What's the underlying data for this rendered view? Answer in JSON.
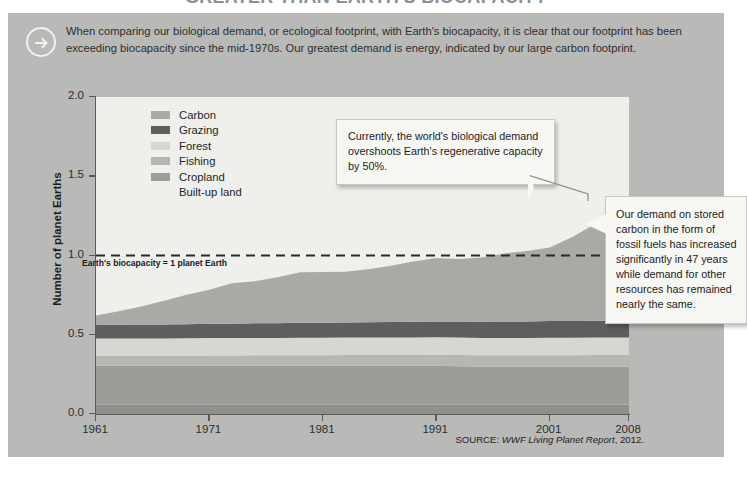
{
  "page": {
    "title_cut_off": "GREATER THAN EARTH'S BIOCAPACITY",
    "source_prefix": "SOURCE: ",
    "source_italic": "WWF Living Planet Report",
    "source_suffix": ", 2012."
  },
  "intro": {
    "icon": "arrow-right-circle-icon",
    "text": "When comparing our biological demand, or ecological footprint, with Earth's biocapacity, it is clear that our footprint has been exceeding biocapacity since the mid-1970s. Our greatest demand is energy, indicated by our large carbon footprint."
  },
  "callouts": [
    {
      "id": "overshoot",
      "text": "Currently, the world's biological demand overshoots Earth's regenerative capacity by 50%."
    },
    {
      "id": "carbon",
      "text": "Our demand on stored carbon in the form of fossil fuels has increased significantly in 47 years while demand for other resources has remained nearly the same."
    }
  ],
  "annotations": {
    "biocapacity_line": "Earth's biocapacity = 1 planet Earth",
    "biocapacity_value": 1.0
  },
  "colors": {
    "panel": "#b9b9b7",
    "plot_bg": "#efefec",
    "carbon": "#a9a9a6",
    "grazing": "#5e5e5e",
    "forest": "#d6d6d2",
    "fishing": "#b6b6b2",
    "cropland": "#9c9c99",
    "builtup": "#8f8f8c",
    "axis": "#5a5a5a",
    "callout_bg": "#f7f7f4"
  },
  "chart_data": {
    "type": "area",
    "stacked": true,
    "title": "",
    "xlabel": "",
    "ylabel": "Number of planet Earths",
    "xlim": [
      1961,
      2008
    ],
    "ylim": [
      0.0,
      2.0
    ],
    "grid": false,
    "legend_position": "upper-left-inside",
    "ytick_labels": [
      "0.0",
      "0.5",
      "1.0",
      "1.5",
      "2.0"
    ],
    "ytick_values": [
      0.0,
      0.5,
      1.0,
      1.5,
      2.0
    ],
    "xtick_labels": [
      "1961",
      "1971",
      "1981",
      "1991",
      "2001",
      "2008"
    ],
    "xtick_values": [
      1961,
      1971,
      1981,
      1991,
      2001,
      2008
    ],
    "x": [
      1961,
      1963,
      1965,
      1967,
      1969,
      1971,
      1973,
      1975,
      1977,
      1979,
      1981,
      1983,
      1985,
      1987,
      1989,
      1991,
      1993,
      1995,
      1997,
      1999,
      2001,
      2003,
      2005,
      2007,
      2008
    ],
    "series": [
      {
        "name": "Built-up land",
        "color": "#8f8f8c",
        "values": [
          0.06,
          0.06,
          0.06,
          0.06,
          0.06,
          0.06,
          0.06,
          0.06,
          0.06,
          0.06,
          0.06,
          0.06,
          0.06,
          0.06,
          0.06,
          0.06,
          0.06,
          0.06,
          0.06,
          0.06,
          0.06,
          0.06,
          0.06,
          0.06,
          0.06
        ]
      },
      {
        "name": "Cropland",
        "color": "#9c9c99",
        "values": [
          0.245,
          0.245,
          0.245,
          0.245,
          0.245,
          0.245,
          0.245,
          0.245,
          0.245,
          0.245,
          0.245,
          0.245,
          0.245,
          0.245,
          0.245,
          0.245,
          0.242,
          0.24,
          0.24,
          0.24,
          0.24,
          0.24,
          0.24,
          0.24,
          0.24
        ]
      },
      {
        "name": "Fishing",
        "color": "#b6b6b2",
        "values": [
          0.062,
          0.062,
          0.062,
          0.062,
          0.063,
          0.064,
          0.064,
          0.065,
          0.065,
          0.066,
          0.066,
          0.067,
          0.067,
          0.068,
          0.068,
          0.069,
          0.07,
          0.07,
          0.07,
          0.07,
          0.071,
          0.071,
          0.072,
          0.072,
          0.072
        ]
      },
      {
        "name": "Forest",
        "color": "#d6d6d2",
        "values": [
          0.11,
          0.11,
          0.11,
          0.11,
          0.11,
          0.11,
          0.11,
          0.11,
          0.11,
          0.11,
          0.11,
          0.11,
          0.11,
          0.11,
          0.11,
          0.11,
          0.11,
          0.11,
          0.11,
          0.11,
          0.11,
          0.11,
          0.11,
          0.11,
          0.11
        ]
      },
      {
        "name": "Grazing",
        "color": "#5e5e5e",
        "values": [
          0.085,
          0.086,
          0.087,
          0.088,
          0.089,
          0.09,
          0.091,
          0.092,
          0.093,
          0.094,
          0.095,
          0.096,
          0.097,
          0.098,
          0.099,
          0.1,
          0.101,
          0.102,
          0.103,
          0.104,
          0.105,
          0.106,
          0.107,
          0.108,
          0.108
        ]
      },
      {
        "name": "Carbon",
        "color": "#a9a9a6",
        "values": [
          0.06,
          0.085,
          0.115,
          0.15,
          0.185,
          0.215,
          0.255,
          0.265,
          0.29,
          0.32,
          0.32,
          0.32,
          0.335,
          0.355,
          0.38,
          0.4,
          0.395,
          0.405,
          0.43,
          0.445,
          0.465,
          0.53,
          0.61,
          0.69,
          0.72
        ]
      }
    ],
    "total_top": {
      "1961": 0.62,
      "1971": 0.79,
      "1981": 0.9,
      "1991": 0.99,
      "2001": 1.06,
      "2008": 1.31
    }
  },
  "legend": {
    "items": [
      {
        "label": "Carbon",
        "color": "#a9a9a6"
      },
      {
        "label": "Grazing",
        "color": "#5e5e5e"
      },
      {
        "label": "Forest",
        "color": "#d6d6d2"
      },
      {
        "label": "Fishing",
        "color": "#b6b6b2"
      },
      {
        "label": "Cropland",
        "color": "#9c9c99"
      },
      {
        "label": "Built-up land",
        "color": "transparent"
      }
    ]
  }
}
